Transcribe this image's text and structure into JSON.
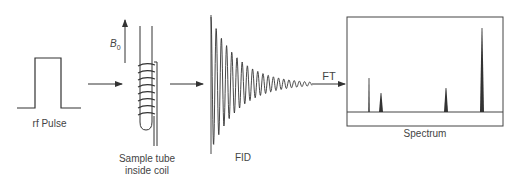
{
  "diagram": {
    "steps": [
      {
        "id": "rf-pulse",
        "label": "rf Pulse"
      },
      {
        "id": "sample",
        "label_line1": "Sample tube",
        "label_line2": "inside coil",
        "field_label": "B",
        "field_subscript": "0"
      },
      {
        "id": "fid",
        "label": "FID"
      },
      {
        "id": "spectrum",
        "label": "Spectrum"
      }
    ],
    "transform_label": "FT",
    "colors": {
      "line": "#333333",
      "background": "#ffffff"
    },
    "spectrum_peaks": [
      {
        "x": 369,
        "top": 78,
        "width": 1.5
      },
      {
        "x": 381,
        "top": 93,
        "width": 4
      },
      {
        "x": 446,
        "top": 88,
        "width": 4
      },
      {
        "x": 482,
        "top": 28,
        "width": 4
      }
    ]
  }
}
